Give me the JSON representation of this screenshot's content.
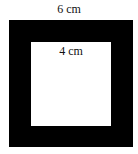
{
  "diagram": {
    "outer_square": {
      "side_label": "6 cm",
      "fill": "#000000"
    },
    "inner_square": {
      "side_label": "4 cm",
      "fill": "#ffffff"
    }
  }
}
